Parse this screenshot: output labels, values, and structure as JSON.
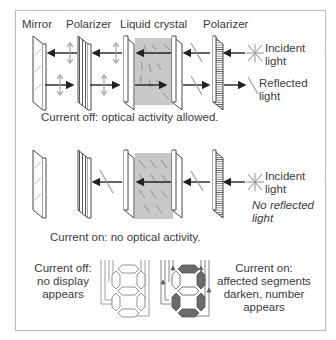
{
  "figure": {
    "column_labels": [
      "Mirror",
      "Polarizer",
      "Liquid crystal",
      "Polarizer"
    ],
    "panel_off": {
      "incident_label": "Incident light",
      "incident_line1": "Incident",
      "incident_line2": "light",
      "reflected_line1": "Reflected",
      "reflected_line2": "light",
      "caption": "Current off: optical activity allowed."
    },
    "panel_on": {
      "incident_line1": "Incident",
      "incident_line2": "light",
      "no_reflected_line1": "No reflected",
      "no_reflected_line2": "light",
      "caption": "Current on: no optical activity."
    },
    "display_off": {
      "line1": "Current off:",
      "line2": "no display",
      "line3": "appears"
    },
    "display_on": {
      "line1": "Current on:",
      "line2": "affected segments",
      "line3": "darken, number",
      "line4": "appears"
    },
    "colors": {
      "lc_fill": "#c8c8c8",
      "plate_outline": "#333333",
      "arrow": "#222222",
      "light_wave": "#9a9a9a",
      "segment_dark": "#6b6b6b",
      "frame_border": "#bdbdbd"
    }
  }
}
